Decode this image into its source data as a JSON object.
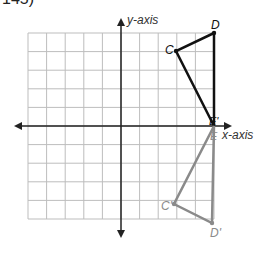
{
  "problem": {
    "number": "145)"
  },
  "axes": {
    "x_label": "x-axis",
    "y_label": "y-axis",
    "range": [
      -5,
      5
    ]
  },
  "grid": {
    "x0": 121,
    "y0": 126,
    "unit": 18.6
  },
  "colors": {
    "original": "#111111",
    "image": "#8a8a8a",
    "grid": "#bdbdbd",
    "axis": "#222222"
  },
  "points": {
    "D": {
      "label": "D",
      "x": 5,
      "y": 5
    },
    "C": {
      "label": "C",
      "x": 3,
      "y": 4
    },
    "E": {
      "label": "E",
      "x": 5,
      "y": 0
    },
    "E_prime": {
      "label": "E'",
      "x": 5,
      "y": 0
    },
    "C_prime": {
      "label": "C'",
      "x": 3,
      "y": -4
    },
    "D_prime": {
      "label": "D'",
      "x": 5,
      "y": -5
    }
  }
}
